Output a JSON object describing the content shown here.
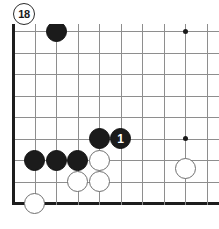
{
  "diagram": {
    "type": "go-board-diagram",
    "figure_number": "18",
    "board": {
      "origin_x": 13,
      "origin_y": 31,
      "spacing": 21.5,
      "cols": 10,
      "rows": 9,
      "left_edge_is_board_border": true,
      "bottom_edge_is_board_border": true,
      "grid_color": "#8e8e8e",
      "border_color": "#1d1d1d"
    },
    "star_points": [
      {
        "col": 8,
        "row": 0
      },
      {
        "col": 8,
        "row": 5
      }
    ],
    "stones": [
      {
        "color": "black",
        "col": 2,
        "row": 0,
        "label": ""
      },
      {
        "color": "black",
        "col": 4,
        "row": 5,
        "label": ""
      },
      {
        "color": "black",
        "col": 5,
        "row": 5,
        "label": "1"
      },
      {
        "color": "black",
        "col": 1,
        "row": 6,
        "label": ""
      },
      {
        "color": "black",
        "col": 2,
        "row": 6,
        "label": ""
      },
      {
        "color": "black",
        "col": 3,
        "row": 6,
        "label": ""
      },
      {
        "color": "white",
        "col": 4,
        "row": 6,
        "label": ""
      },
      {
        "color": "white",
        "col": 3,
        "row": 7,
        "label": ""
      },
      {
        "color": "white",
        "col": 4,
        "row": 7,
        "label": ""
      },
      {
        "color": "white",
        "col": 8,
        "row": 6.4,
        "label": ""
      },
      {
        "color": "white",
        "col": 1,
        "row": 8,
        "label": ""
      }
    ],
    "colors": {
      "black_stone": "#1b1b1b",
      "white_stone": "#ffffff",
      "white_stone_border": "#6f6f6f",
      "label_on_black": "#ffffff",
      "background": "#ffffff"
    }
  }
}
